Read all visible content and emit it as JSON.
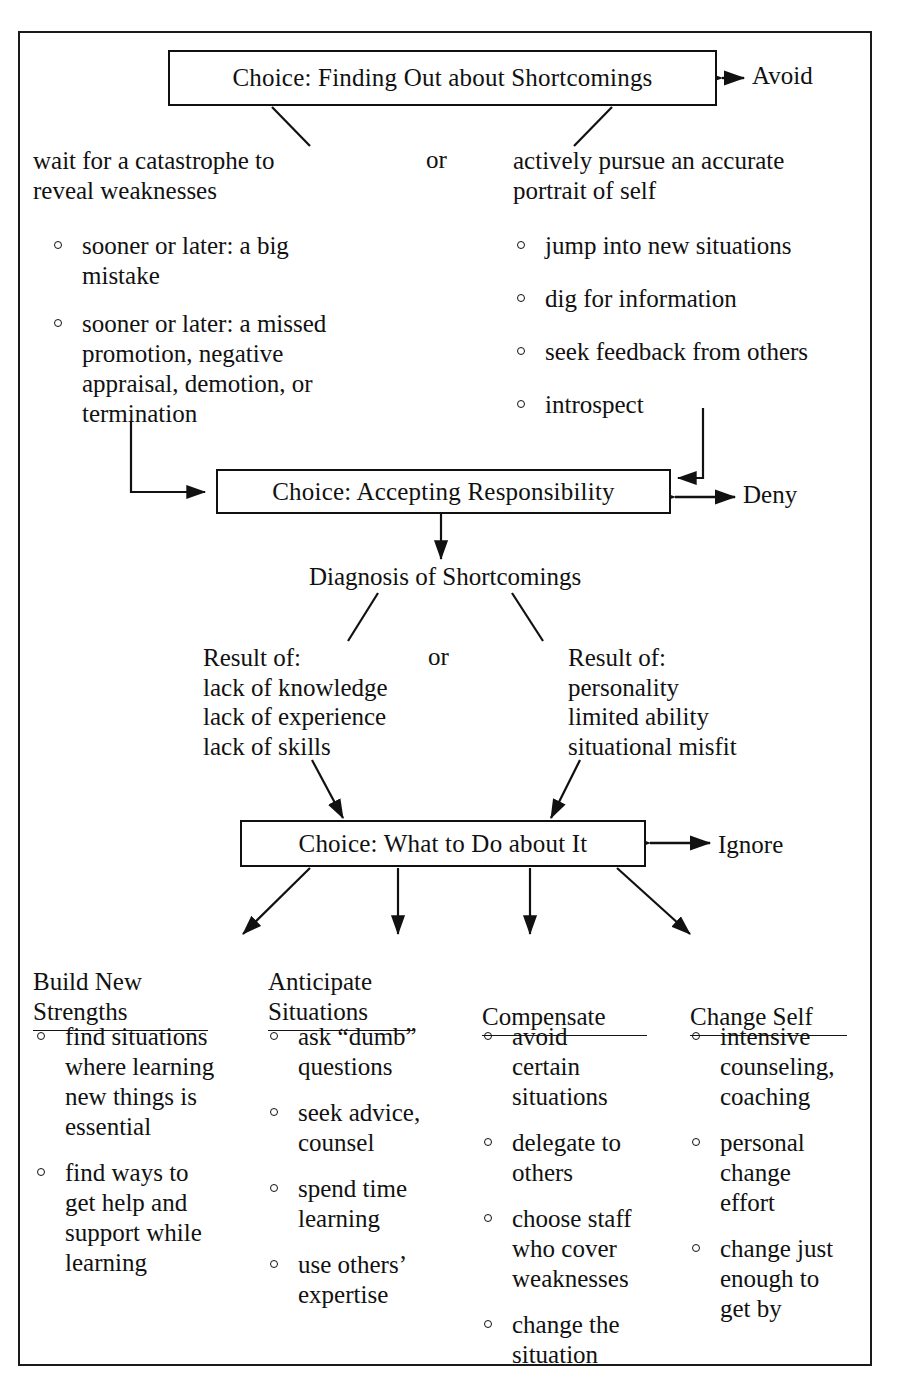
{
  "diagram": {
    "title_nodes": {
      "top": "Choice: Finding Out about Shortcomings",
      "middle": "Choice: Accepting Responsibility",
      "bottom": "Choice: What to Do about It",
      "diagnosis": "Diagnosis of Shortcomings"
    },
    "escape_labels": {
      "top": "Avoid",
      "middle": "Deny",
      "bottom": "Ignore"
    },
    "or_labels": {
      "upper": "or",
      "lower": "or"
    },
    "branch_top_left": {
      "heading": "wait for a catastrophe to\nreveal weaknesses",
      "bullets": [
        "sooner or later: a big\nmistake",
        "sooner or later: a missed\npromotion, negative\nappraisal, demotion, or\ntermination"
      ]
    },
    "branch_top_right": {
      "heading": "actively pursue an accurate\nportrait of self",
      "bullets": [
        "jump into new situations",
        "dig for information",
        "seek feedback from others",
        "introspect"
      ]
    },
    "diagnosis_left": {
      "lines": "Result of:\nlack of knowledge\nlack of experience\nlack of skills"
    },
    "diagnosis_right": {
      "lines": "Result of:\npersonality\nlimited ability\nsituational misfit"
    },
    "action_columns": [
      {
        "heading": "Build New\nStrengths",
        "bullets": [
          "find situations\nwhere learning\nnew things is\nessential",
          "find ways to\nget help and\nsupport while\nlearning"
        ]
      },
      {
        "heading": "Anticipate\nSituations",
        "bullets": [
          "ask “dumb”\nquestions",
          "seek advice,\ncounsel",
          "spend time\nlearning",
          "use others’\nexpertise"
        ]
      },
      {
        "heading": "Compensate",
        "bullets": [
          "avoid\ncertain\nsituations",
          "delegate to\nothers",
          "choose staff\nwho cover\nweaknesses",
          "change the\nsituation"
        ]
      },
      {
        "heading": "Change Self",
        "bullets": [
          "intensive\ncounseling,\ncoaching",
          "personal\nchange\neffort",
          "change just\nenough to\nget by"
        ]
      }
    ],
    "colors": {
      "ink": "#111111",
      "paper": "#ffffff"
    }
  }
}
